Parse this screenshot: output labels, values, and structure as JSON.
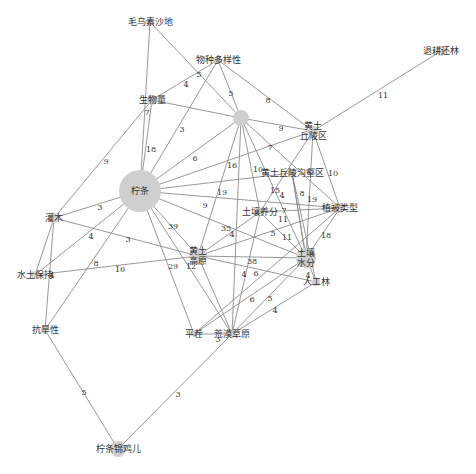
{
  "figure": {
    "type": "keyword co-occurrence network",
    "colors": {
      "edge": "#8c8c8c",
      "node": "#cfcfcf",
      "label": "#333333",
      "background": "#ffffff"
    }
  },
  "nodes": [
    {
      "id": "maowusu",
      "label": "毛乌素沙地",
      "x": 150,
      "y": 22,
      "r": 4
    },
    {
      "id": "wuzhong",
      "label": "物种多样性",
      "x": 218,
      "y": 60,
      "r": 4
    },
    {
      "id": "tuigeng",
      "label": "退耕还林",
      "x": 441,
      "y": 51,
      "r": 5
    },
    {
      "id": "shengwu",
      "label": "生物量",
      "x": 152,
      "y": 100,
      "r": 5
    },
    {
      "id": "unnamed",
      "label": "",
      "x": 241,
      "y": 118,
      "r": 8
    },
    {
      "id": "huangqiuling",
      "label": "黄土\n丘陵区",
      "x": 313,
      "y": 131,
      "r": 5
    },
    {
      "id": "ningtiao",
      "label": "柠条",
      "x": 140,
      "y": 191,
      "r": 21
    },
    {
      "id": "goubhe",
      "label": "黄土丘陵沟壑区",
      "x": 292,
      "y": 173,
      "r": 4
    },
    {
      "id": "zhibei",
      "label": "植被类型",
      "x": 340,
      "y": 208,
      "r": 5
    },
    {
      "id": "yangfen",
      "label": "土壤养分",
      "x": 260,
      "y": 212,
      "r": 4
    },
    {
      "id": "guanmu",
      "label": "灌木",
      "x": 54,
      "y": 218,
      "r": 5
    },
    {
      "id": "gaoyuan",
      "label": "黄土\n高原",
      "x": 198,
      "y": 256,
      "r": 8
    },
    {
      "id": "shuifen",
      "label": "土壤\n水分",
      "x": 306,
      "y": 258,
      "r": 10
    },
    {
      "id": "shuitu",
      "label": "水土保持",
      "x": 35,
      "y": 275,
      "r": 4
    },
    {
      "id": "rengong",
      "label": "人工林",
      "x": 316,
      "y": 282,
      "r": 4
    },
    {
      "id": "kanghan",
      "label": "抗旱性",
      "x": 45,
      "y": 330,
      "r": 4
    },
    {
      "id": "pingcha",
      "label": "平茬",
      "x": 194,
      "y": 334,
      "r": 3
    },
    {
      "id": "huangmo",
      "label": "荒漠草原",
      "x": 232,
      "y": 334,
      "r": 4
    },
    {
      "id": "jinjier",
      "label": "柠条锦鸡儿",
      "x": 118,
      "y": 449,
      "r": 8
    }
  ],
  "edges": [
    {
      "s": "maowusu",
      "t": "ningtiao",
      "w": "18",
      "lx": 151,
      "ly": 150
    },
    {
      "s": "maowusu",
      "t": "unnamed",
      "w": "5",
      "lx": 199,
      "ly": 75
    },
    {
      "s": "wuzhong",
      "t": "shengwu",
      "w": "4",
      "lx": 186,
      "ly": 85
    },
    {
      "s": "wuzhong",
      "t": "unnamed",
      "w": "5",
      "lx": 231,
      "ly": 94
    },
    {
      "s": "wuzhong",
      "t": "huangqiuling",
      "w": "8",
      "lx": 268,
      "ly": 101
    },
    {
      "s": "wuzhong",
      "t": "ningtiao",
      "w": "3",
      "lx": 182,
      "ly": 130
    },
    {
      "s": "tuigeng",
      "t": "huangqiuling",
      "w": "11",
      "lx": 383,
      "ly": 96
    },
    {
      "s": "shengwu",
      "t": "unnamed",
      "w": "",
      "lx": 0,
      "ly": 0
    },
    {
      "s": "shengwu",
      "t": "ningtiao",
      "w": "7",
      "lx": 147,
      "ly": 113
    },
    {
      "s": "shengwu",
      "t": "guanmu",
      "w": "9",
      "lx": 106,
      "ly": 162
    },
    {
      "s": "unnamed",
      "t": "ningtiao",
      "w": "6",
      "lx": 195,
      "ly": 159
    },
    {
      "s": "unnamed",
      "t": "huangqiuling",
      "w": "9",
      "lx": 281,
      "ly": 129
    },
    {
      "s": "unnamed",
      "t": "yangfen",
      "w": "10",
      "lx": 258,
      "ly": 170
    },
    {
      "s": "unnamed",
      "t": "gaoyuan",
      "w": "19",
      "lx": 222,
      "ly": 193
    },
    {
      "s": "unnamed",
      "t": "shuifen",
      "w": "15",
      "lx": 275,
      "ly": 191
    },
    {
      "s": "unnamed",
      "t": "zhibei",
      "w": "8",
      "lx": 302,
      "ly": 194
    },
    {
      "s": "unnamed",
      "t": "huangmo",
      "w": "",
      "lx": 0,
      "ly": 0
    },
    {
      "s": "huangqiuling",
      "t": "ningtiao",
      "w": "7",
      "lx": 270,
      "ly": 148
    },
    {
      "s": "huangqiuling",
      "t": "zhibei",
      "w": "10",
      "lx": 333,
      "ly": 174
    },
    {
      "s": "huangqiuling",
      "t": "shuifen",
      "w": "19",
      "lx": 312,
      "ly": 200
    },
    {
      "s": "huangqiuling",
      "t": "yangfen",
      "w": "4",
      "lx": 282,
      "ly": 196
    },
    {
      "s": "ningtiao",
      "t": "goubhe",
      "w": "16",
      "lx": 232,
      "ly": 166
    },
    {
      "s": "ningtiao",
      "t": "zhibei",
      "w": "9",
      "lx": 205,
      "ly": 206
    },
    {
      "s": "ningtiao",
      "t": "gaoyuan",
      "w": "39",
      "lx": 173,
      "ly": 227
    },
    {
      "s": "ningtiao",
      "t": "shuifen",
      "w": "35",
      "lx": 226,
      "ly": 229
    },
    {
      "s": "ningtiao",
      "t": "guanmu",
      "w": "3",
      "lx": 100,
      "ly": 208
    },
    {
      "s": "ningtiao",
      "t": "pingcha",
      "w": "29",
      "lx": 173,
      "ly": 267
    },
    {
      "s": "ningtiao",
      "t": "huangmo",
      "w": "",
      "lx": 0,
      "ly": 0
    },
    {
      "s": "ningtiao",
      "t": "shuitu",
      "w": "4",
      "lx": 91,
      "ly": 237
    },
    {
      "s": "ningtiao",
      "t": "kanghan",
      "w": "8",
      "lx": 96,
      "ly": 264
    },
    {
      "s": "goubhe",
      "t": "shuifen",
      "w": "",
      "lx": 0,
      "ly": 0
    },
    {
      "s": "goubhe",
      "t": "rengong",
      "w": "",
      "lx": 0,
      "ly": 0
    },
    {
      "s": "yangfen",
      "t": "zhibei",
      "w": "7",
      "lx": 284,
      "ly": 211
    },
    {
      "s": "yangfen",
      "t": "gaoyuan",
      "w": "4",
      "lx": 232,
      "ly": 235
    },
    {
      "s": "yangfen",
      "t": "huangmo",
      "w": "4",
      "lx": 244,
      "ly": 275
    },
    {
      "s": "zhibei",
      "t": "gaoyuan",
      "w": "5",
      "lx": 273,
      "ly": 234
    },
    {
      "s": "zhibei",
      "t": "shuifen",
      "w": "18",
      "lx": 326,
      "ly": 236
    },
    {
      "s": "zhibei",
      "t": "pingcha",
      "w": "11",
      "lx": 283,
      "ly": 220
    },
    {
      "s": "gaoyuan",
      "t": "shuifen",
      "w": "38",
      "lx": 252,
      "ly": 262
    },
    {
      "s": "gaoyuan",
      "t": "guanmu",
      "w": "3",
      "lx": 128,
      "ly": 240
    },
    {
      "s": "gaoyuan",
      "t": "shuitu",
      "w": "10",
      "lx": 120,
      "ly": 270
    },
    {
      "s": "gaoyuan",
      "t": "huangmo",
      "w": "12",
      "lx": 191,
      "ly": 267
    },
    {
      "s": "gaoyuan",
      "t": "rengong",
      "w": "",
      "lx": 0,
      "ly": 0
    },
    {
      "s": "shuifen",
      "t": "pingcha",
      "w": "6",
      "lx": 252,
      "ly": 300
    },
    {
      "s": "shuifen",
      "t": "huangmo",
      "w": "5",
      "lx": 270,
      "ly": 299
    },
    {
      "s": "shuifen",
      "t": "rengong",
      "w": "4",
      "lx": 308,
      "ly": 276
    },
    {
      "s": "shuifen",
      "t": "goubhe",
      "w": "11",
      "lx": 287,
      "ly": 238
    },
    {
      "s": "shuifen",
      "t": "yangfen",
      "w": "6",
      "lx": 256,
      "ly": 274
    },
    {
      "s": "rengong",
      "t": "huangmo",
      "w": "4",
      "lx": 275,
      "ly": 311
    },
    {
      "s": "pingcha",
      "t": "huangmo",
      "w": "3",
      "lx": 218,
      "ly": 340
    },
    {
      "s": "guanmu",
      "t": "kanghan",
      "w": "4",
      "lx": 52,
      "ly": 276
    },
    {
      "s": "guanmu",
      "t": "shuitu",
      "w": "",
      "lx": 0,
      "ly": 0
    },
    {
      "s": "kanghan",
      "t": "jinjier",
      "w": "5",
      "lx": 84,
      "ly": 393
    },
    {
      "s": "huangmo",
      "t": "jinjier",
      "w": "3",
      "lx": 178,
      "ly": 395
    }
  ],
  "caption": ""
}
